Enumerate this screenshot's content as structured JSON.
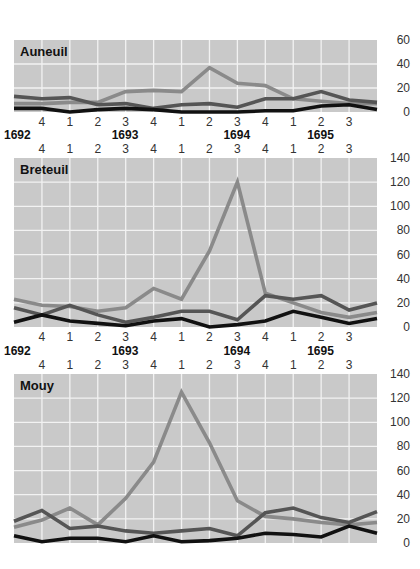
{
  "colors": {
    "plot_bg": "#c9c9c9",
    "grid": "#f2f2f2",
    "series_light": "#8a8a8a",
    "series_mid": "#555555",
    "series_dark": "#111111",
    "tick_text": "#333333",
    "title_text": "#111111"
  },
  "quarter_labels": [
    "4",
    "1",
    "2",
    "3",
    "4",
    "1",
    "2",
    "3",
    "4",
    "1",
    "2",
    "3"
  ],
  "year_labels": [
    {
      "label": "1692",
      "index": 0
    },
    {
      "label": "1693",
      "index": 3
    },
    {
      "label": "1694",
      "index": 7
    },
    {
      "label": "1695",
      "index": 10
    }
  ],
  "chart_data": [
    {
      "type": "line",
      "title": "Auneuil",
      "xlabel": "Quarter / Year",
      "ylabel": "",
      "x": [
        "1692 Q3",
        "1692 Q4",
        "1693 Q1",
        "1693 Q2",
        "1693 Q3",
        "1693 Q4",
        "1694 Q1",
        "1694 Q2",
        "1694 Q3",
        "1694 Q4",
        "1695 Q1",
        "1695 Q2",
        "1695 Q3",
        "1695 Q4"
      ],
      "ylim": [
        0,
        60
      ],
      "yticks": [
        0,
        20,
        40,
        60
      ],
      "grid": true,
      "series": [
        {
          "name": "light",
          "values": [
            7,
            7,
            8,
            8,
            17,
            18,
            17,
            37,
            24,
            22,
            11,
            9,
            7,
            7
          ]
        },
        {
          "name": "mid",
          "values": [
            13,
            11,
            12,
            6,
            7,
            3,
            6,
            7,
            4,
            11,
            11,
            17,
            10,
            8
          ]
        },
        {
          "name": "dark",
          "values": [
            3,
            3,
            0,
            2,
            3,
            2,
            0,
            0,
            0,
            1,
            1,
            5,
            6,
            2
          ]
        }
      ]
    },
    {
      "type": "line",
      "title": "Breteuil",
      "xlabel": "Quarter / Year",
      "ylabel": "",
      "x": [
        "1692 Q3",
        "1692 Q4",
        "1693 Q1",
        "1693 Q2",
        "1693 Q3",
        "1693 Q4",
        "1694 Q1",
        "1694 Q2",
        "1694 Q3",
        "1694 Q4",
        "1695 Q1",
        "1695 Q2",
        "1695 Q3",
        "1695 Q4"
      ],
      "ylim": [
        0,
        140
      ],
      "yticks": [
        0,
        20,
        40,
        60,
        80,
        100,
        120,
        140
      ],
      "grid": true,
      "series": [
        {
          "name": "light",
          "values": [
            23,
            18,
            17,
            13,
            16,
            32,
            23,
            63,
            120,
            28,
            20,
            12,
            8,
            12
          ]
        },
        {
          "name": "mid",
          "values": [
            16,
            10,
            18,
            10,
            4,
            8,
            13,
            13,
            6,
            26,
            23,
            26,
            14,
            20
          ]
        },
        {
          "name": "dark",
          "values": [
            4,
            10,
            5,
            3,
            1,
            5,
            7,
            0,
            2,
            5,
            13,
            8,
            3,
            7
          ]
        }
      ]
    },
    {
      "type": "line",
      "title": "Mouy",
      "xlabel": "Quarter / Year",
      "ylabel": "",
      "x": [
        "1692 Q3",
        "1692 Q4",
        "1693 Q1",
        "1693 Q2",
        "1693 Q3",
        "1693 Q4",
        "1694 Q1",
        "1694 Q2",
        "1694 Q3",
        "1694 Q4",
        "1695 Q1",
        "1695 Q2",
        "1695 Q3",
        "1695 Q4"
      ],
      "ylim": [
        0,
        140
      ],
      "yticks": [
        0,
        20,
        40,
        60,
        80,
        100,
        120,
        140
      ],
      "grid": true,
      "series": [
        {
          "name": "light",
          "values": [
            13,
            19,
            29,
            15,
            37,
            67,
            125,
            83,
            35,
            22,
            20,
            17,
            15,
            17
          ]
        },
        {
          "name": "mid",
          "values": [
            18,
            27,
            12,
            14,
            10,
            8,
            10,
            12,
            6,
            25,
            29,
            21,
            17,
            26
          ]
        },
        {
          "name": "dark",
          "values": [
            6,
            1,
            4,
            4,
            1,
            6,
            1,
            2,
            4,
            8,
            7,
            5,
            14,
            8
          ]
        }
      ]
    }
  ]
}
